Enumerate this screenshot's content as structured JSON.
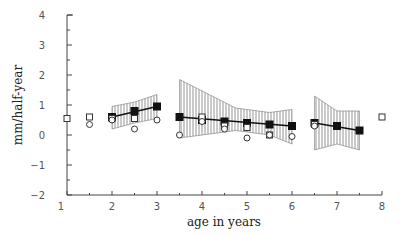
{
  "chart_data": {
    "type": "scatter",
    "title": "",
    "xlabel": "age in years",
    "ylabel": "mm/half-year",
    "xlim": [
      1,
      8
    ],
    "ylim": [
      -2,
      4
    ],
    "x_ticks": [
      1,
      2,
      3,
      4,
      5,
      6,
      7,
      8
    ],
    "y_ticks": [
      -2,
      -1,
      0,
      1,
      2,
      3,
      4
    ],
    "grid": false,
    "legend": null,
    "series": [
      {
        "name": "filled squares (regression segments)",
        "marker": "filled-square",
        "points": [
          {
            "x": 2.0,
            "y": 0.6
          },
          {
            "x": 2.5,
            "y": 0.8
          },
          {
            "x": 3.0,
            "y": 0.95
          },
          {
            "x": 3.5,
            "y": 0.6
          },
          {
            "x": 4.0,
            "y": 0.5
          },
          {
            "x": 4.5,
            "y": 0.45
          },
          {
            "x": 5.0,
            "y": 0.4
          },
          {
            "x": 5.5,
            "y": 0.35
          },
          {
            "x": 6.0,
            "y": 0.3
          },
          {
            "x": 6.5,
            "y": 0.4
          },
          {
            "x": 7.0,
            "y": 0.3
          },
          {
            "x": 7.5,
            "y": 0.15
          }
        ]
      },
      {
        "name": "open squares",
        "marker": "open-square",
        "points": [
          {
            "x": 1.0,
            "y": 0.55
          },
          {
            "x": 1.5,
            "y": 0.6
          },
          {
            "x": 2.0,
            "y": 0.55
          },
          {
            "x": 2.5,
            "y": 0.55
          },
          {
            "x": 4.0,
            "y": 0.6
          },
          {
            "x": 4.5,
            "y": 0.3
          },
          {
            "x": 5.0,
            "y": 0.25
          },
          {
            "x": 5.5,
            "y": 0.0
          },
          {
            "x": 6.5,
            "y": 0.35
          },
          {
            "x": 8.0,
            "y": 0.6
          }
        ]
      },
      {
        "name": "open circles",
        "marker": "open-circle",
        "points": [
          {
            "x": 1.5,
            "y": 0.35
          },
          {
            "x": 2.0,
            "y": 0.5
          },
          {
            "x": 2.5,
            "y": 0.2
          },
          {
            "x": 3.0,
            "y": 0.5
          },
          {
            "x": 3.5,
            "y": 0.0
          },
          {
            "x": 4.0,
            "y": 0.45
          },
          {
            "x": 4.5,
            "y": 0.2
          },
          {
            "x": 5.0,
            "y": -0.1
          },
          {
            "x": 5.5,
            "y": 0.0
          },
          {
            "x": 6.0,
            "y": -0.05
          },
          {
            "x": 6.5,
            "y": 0.3
          }
        ]
      }
    ],
    "regression_segments": [
      {
        "x_start": 2.0,
        "x_end": 3.0,
        "y_start": 0.6,
        "y_end": 0.95,
        "band_upper": [
          [
            2.0,
            0.95
          ],
          [
            2.5,
            1.1
          ],
          [
            3.0,
            1.35
          ]
        ],
        "band_lower": [
          [
            2.0,
            0.2
          ],
          [
            2.5,
            0.4
          ],
          [
            3.0,
            0.55
          ]
        ]
      },
      {
        "x_start": 3.5,
        "x_end": 6.0,
        "y_start": 0.6,
        "y_end": 0.3,
        "band_upper": [
          [
            3.5,
            1.85
          ],
          [
            4.75,
            0.9
          ],
          [
            5.5,
            0.75
          ],
          [
            6.0,
            0.85
          ]
        ],
        "band_lower": [
          [
            3.5,
            -0.1
          ],
          [
            4.75,
            0.15
          ],
          [
            5.5,
            0.0
          ],
          [
            6.0,
            -0.3
          ]
        ]
      },
      {
        "x_start": 6.5,
        "x_end": 7.5,
        "y_start": 0.4,
        "y_end": 0.15,
        "band_upper": [
          [
            6.5,
            1.3
          ],
          [
            7.0,
            0.8
          ],
          [
            7.5,
            0.8
          ]
        ],
        "band_lower": [
          [
            6.5,
            -0.5
          ],
          [
            7.0,
            -0.3
          ],
          [
            7.5,
            -0.5
          ]
        ]
      }
    ]
  },
  "labels": {
    "xlabel": "age in years",
    "ylabel": "mm/half-year"
  }
}
